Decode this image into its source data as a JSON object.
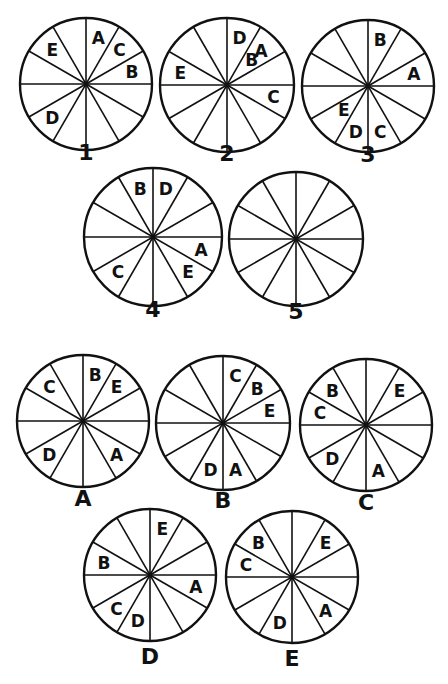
{
  "puzzle": {
    "description": "Sequence of 12-segment circles with letters; choose the option that continues the pattern as circle 5",
    "segments_per_circle": 12,
    "segment_indexing": "clockwise from 12 o'clock, segment 0 = 0-30deg",
    "question_circles": [
      {
        "label": "1",
        "cx": 86,
        "cy": 84,
        "r": 66,
        "label_y": 160,
        "letters": [
          {
            "ch": "A",
            "seg": 0
          },
          {
            "ch": "C",
            "seg": 1
          },
          {
            "ch": "B",
            "seg": 2
          },
          {
            "ch": "D",
            "seg": 7
          },
          {
            "ch": "E",
            "seg": 10
          }
        ]
      },
      {
        "label": "2",
        "cx": 227,
        "cy": 85,
        "r": 67,
        "label_y": 161,
        "letters": [
          {
            "ch": "D",
            "seg": 0
          },
          {
            "ch": "B",
            "seg": 1,
            "inner": true
          },
          {
            "ch": "A",
            "seg": 1
          },
          {
            "ch": "C",
            "seg": 3
          },
          {
            "ch": "E",
            "seg": 9
          }
        ]
      },
      {
        "label": "3",
        "cx": 368,
        "cy": 86,
        "r": 66,
        "label_y": 162,
        "letters": [
          {
            "ch": "B",
            "seg": 0
          },
          {
            "ch": "A",
            "seg": 2
          },
          {
            "ch": "C",
            "seg": 5
          },
          {
            "ch": "D",
            "seg": 6
          },
          {
            "ch": "E",
            "seg": 7,
            "inner": true
          }
        ]
      },
      {
        "label": "4",
        "cx": 153,
        "cy": 237,
        "r": 69,
        "label_y": 317,
        "letters": [
          {
            "ch": "D",
            "seg": 0
          },
          {
            "ch": "A",
            "seg": 3
          },
          {
            "ch": "E",
            "seg": 4
          },
          {
            "ch": "C",
            "seg": 7
          },
          {
            "ch": "B",
            "seg": 11
          }
        ]
      },
      {
        "label": "5",
        "cx": 296,
        "cy": 239,
        "r": 67,
        "label_y": 319,
        "letters": []
      }
    ],
    "answer_options": [
      {
        "label": "A",
        "cx": 83,
        "cy": 421,
        "r": 66,
        "label_y": 506,
        "letters": [
          {
            "ch": "B",
            "seg": 0
          },
          {
            "ch": "E",
            "seg": 1
          },
          {
            "ch": "A",
            "seg": 4
          },
          {
            "ch": "D",
            "seg": 7
          },
          {
            "ch": "C",
            "seg": 10
          }
        ]
      },
      {
        "label": "B",
        "cx": 223,
        "cy": 423,
        "r": 67,
        "label_y": 508,
        "letters": [
          {
            "ch": "C",
            "seg": 0
          },
          {
            "ch": "B",
            "seg": 1
          },
          {
            "ch": "E",
            "seg": 2
          },
          {
            "ch": "A",
            "seg": 5
          },
          {
            "ch": "D",
            "seg": 6
          }
        ]
      },
      {
        "label": "C",
        "cx": 366,
        "cy": 425,
        "r": 66,
        "label_y": 510,
        "letters": [
          {
            "ch": "E",
            "seg": 1
          },
          {
            "ch": "A",
            "seg": 5
          },
          {
            "ch": "D",
            "seg": 7
          },
          {
            "ch": "C",
            "seg": 9
          },
          {
            "ch": "B",
            "seg": 10
          }
        ]
      },
      {
        "label": "D",
        "cx": 150,
        "cy": 575,
        "r": 66,
        "label_y": 664,
        "letters": [
          {
            "ch": "E",
            "seg": 0
          },
          {
            "ch": "A",
            "seg": 3
          },
          {
            "ch": "D",
            "seg": 6
          },
          {
            "ch": "C",
            "seg": 7
          },
          {
            "ch": "B",
            "seg": 9
          }
        ]
      },
      {
        "label": "E",
        "cx": 292,
        "cy": 577,
        "r": 66,
        "label_y": 666,
        "letters": [
          {
            "ch": "E",
            "seg": 1
          },
          {
            "ch": "A",
            "seg": 4
          },
          {
            "ch": "D",
            "seg": 6
          },
          {
            "ch": "C",
            "seg": 9
          },
          {
            "ch": "B",
            "seg": 10
          }
        ]
      }
    ],
    "colors": {
      "stroke": "#111111",
      "background": "#ffffff"
    }
  }
}
